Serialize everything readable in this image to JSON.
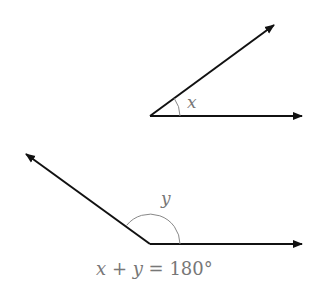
{
  "diagram": {
    "top_angle": {
      "label": "x"
    },
    "bottom_angle": {
      "label": "y"
    },
    "equation": {
      "x": "x",
      "plus": " + ",
      "y": "y",
      "eq": " = 180°"
    },
    "colors": {
      "ray": "#111111",
      "arc": "#888888",
      "text": "#777777"
    }
  }
}
